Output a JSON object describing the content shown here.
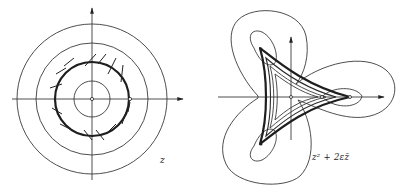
{
  "figure": {
    "left_panel": {
      "label": "z",
      "description": "Concentric circles with a bold circle carrying transversal hatch marks; coordinate axes with arrows",
      "center": [
        92,
        98
      ],
      "circle_radii": [
        18,
        38,
        56,
        75
      ],
      "bold_circle_radius": 38
    },
    "right_panel": {
      "label": "z² + 2εz̄",
      "description": "Image of circles under map z² + 2εz̄: deltoid-like curvilinear triangle with nested level curves and three-lobed outer loops; coordinate axes with arrows",
      "center": [
        291,
        97
      ]
    }
  }
}
